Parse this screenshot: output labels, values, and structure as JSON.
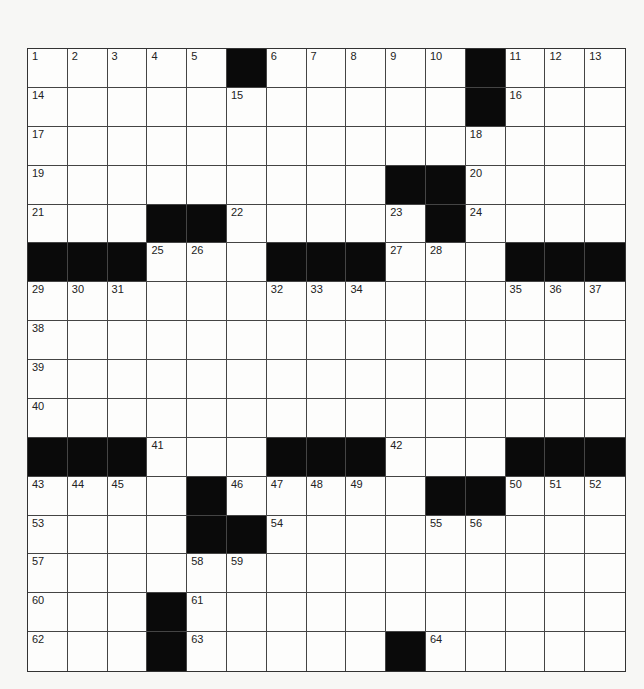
{
  "puzzle": {
    "rows": 16,
    "cols": 15,
    "layout": [
      "#####X######X###",
      "",
      ""
    ],
    "grid": [
      [
        1,
        2,
        3,
        4,
        5,
        "#",
        6,
        7,
        8,
        9,
        10,
        "#",
        11,
        12,
        13
      ],
      [
        14,
        0,
        0,
        0,
        0,
        15,
        0,
        0,
        0,
        0,
        0,
        "#",
        16,
        0,
        0
      ],
      [
        17,
        0,
        0,
        0,
        0,
        0,
        0,
        0,
        0,
        0,
        0,
        18,
        0,
        0,
        0
      ],
      [
        19,
        0,
        0,
        0,
        0,
        0,
        0,
        0,
        0,
        "#",
        "#",
        20,
        0,
        0,
        0
      ],
      [
        21,
        0,
        0,
        "#",
        "#",
        22,
        0,
        0,
        0,
        23,
        "#",
        24,
        0,
        0,
        0
      ],
      [
        "#",
        "#",
        "#",
        25,
        26,
        0,
        "#",
        "#",
        "#",
        27,
        28,
        0,
        "#",
        "#",
        "#"
      ],
      [
        29,
        30,
        31,
        0,
        0,
        0,
        32,
        33,
        34,
        0,
        0,
        0,
        35,
        36,
        37
      ],
      [
        38,
        0,
        0,
        0,
        0,
        0,
        0,
        0,
        0,
        0,
        0,
        0,
        0,
        0,
        0
      ],
      [
        39,
        0,
        0,
        0,
        0,
        0,
        0,
        0,
        0,
        0,
        0,
        0,
        0,
        0,
        0
      ],
      [
        40,
        0,
        0,
        0,
        0,
        0,
        0,
        0,
        0,
        0,
        0,
        0,
        0,
        0,
        0
      ],
      [
        "#",
        "#",
        "#",
        41,
        0,
        0,
        "#",
        "#",
        "#",
        42,
        0,
        0,
        "#",
        "#",
        "#"
      ],
      [
        43,
        44,
        45,
        0,
        "#",
        46,
        47,
        48,
        49,
        0,
        "#",
        "#",
        50,
        51,
        52
      ],
      [
        53,
        0,
        0,
        0,
        "#",
        "#",
        54,
        0,
        0,
        0,
        55,
        56,
        0,
        0,
        0
      ],
      [
        57,
        0,
        0,
        0,
        58,
        59,
        0,
        0,
        0,
        0,
        0,
        0,
        0,
        0,
        0
      ],
      [
        60,
        0,
        0,
        "#",
        61,
        0,
        0,
        0,
        0,
        0,
        0,
        0,
        0,
        0,
        0
      ],
      [
        62,
        0,
        0,
        "#",
        63,
        0,
        0,
        0,
        0,
        "#",
        64,
        0,
        0,
        0,
        0
      ]
    ],
    "colors": {
      "block": "#0a0a0a",
      "cell": "#fdfdfc",
      "line": "#444444",
      "number": "#222222"
    }
  }
}
